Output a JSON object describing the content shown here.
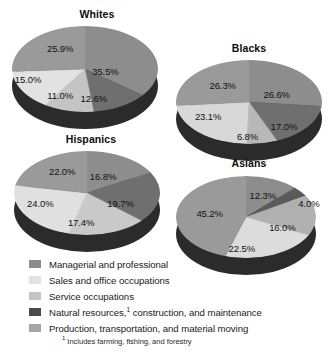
{
  "colors": {
    "managerial": "#8d8d8d",
    "sales": "#e2e2e2",
    "service": "#c4c4c4",
    "natural_resources": "#4a4a4a",
    "production": "#a5a5a5",
    "pie_side": "#2b2b2b",
    "text": "#111111",
    "background": "#ffffff"
  },
  "legend": {
    "items": [
      {
        "label": "Managerial and professional",
        "color": "#8d8d8d",
        "swatch_name": "legend-swatch-managerial"
      },
      {
        "label": "Sales and office occupations",
        "color": "#e2e2e2",
        "swatch_name": "legend-swatch-sales"
      },
      {
        "label": "Service occupations",
        "color": "#c4c4c4",
        "swatch_name": "legend-swatch-service"
      },
      {
        "label": "Natural resources, construction, and maintenance",
        "label_prefix": "Natural resources,",
        "label_suffix": " construction, and maintenance",
        "footnote_marker": "1",
        "color": "#4a4a4a",
        "swatch_name": "legend-swatch-natural-resources"
      },
      {
        "label": "Production, transportation, and material moving",
        "color": "#a5a5a5",
        "swatch_name": "legend-swatch-production"
      }
    ]
  },
  "footnote": {
    "marker": "1",
    "text": " Includes farming, fishing, and forestry"
  },
  "chart_data": [
    {
      "type": "pie",
      "title": "Whites",
      "labels": [
        "Managerial and professional",
        "Natural resources, construction, and maintenance",
        "Service occupations",
        "Sales and office occupations",
        "Production, transportation, and material moving"
      ],
      "values": [
        35.5,
        12.6,
        11.0,
        15.0,
        25.9
      ],
      "value_labels": [
        "35.5%",
        "12.6%",
        "11.0%",
        "15.0%",
        "25.9%"
      ],
      "colors": [
        "#8d8d8d",
        "#6f6f6f",
        "#c4c4c4",
        "#e2e2e2",
        "#9a9a9a"
      ],
      "legend_position": "bottom"
    },
    {
      "type": "pie",
      "title": "Blacks",
      "labels": [
        "Managerial and professional",
        "Production, transportation, and material moving",
        "Natural resources, construction, and maintenance",
        "Service occupations",
        "Sales and office occupations"
      ],
      "values": [
        26.6,
        17.0,
        6.8,
        23.1,
        26.3
      ],
      "value_labels": [
        "26.6%",
        "17.0%",
        "6.8%",
        "23.1%",
        "26.3%"
      ],
      "colors": [
        "#8d8d8d",
        "#6f6f6f",
        "#b8b8b8",
        "#d8d8d8",
        "#9a9a9a"
      ],
      "legend_position": "bottom"
    },
    {
      "type": "pie",
      "title": "Hispanics",
      "labels": [
        "Managerial and professional",
        "Natural resources, construction, and maintenance",
        "Production, transportation, and material moving",
        "Service occupations",
        "Sales and office occupations"
      ],
      "values": [
        16.8,
        19.7,
        17.4,
        24.0,
        22.0
      ],
      "value_labels": [
        "16.8%",
        "19.7%",
        "17.4%",
        "24.0%",
        "22.0%"
      ],
      "colors": [
        "#8d8d8d",
        "#6f6f6f",
        "#c9c9c9",
        "#e0e0e0",
        "#9a9a9a"
      ],
      "legend_position": "bottom"
    },
    {
      "type": "pie",
      "title": "Asians",
      "labels": [
        "Managerial and professional",
        "Natural resources, construction, and maintenance",
        "Production, transportation, and material moving",
        "Service occupations",
        "Sales and office occupations"
      ],
      "values": [
        12.3,
        4.0,
        16.0,
        22.5,
        45.2
      ],
      "value_labels": [
        "12.3%",
        "4.0%",
        "16.0%",
        "22.5%",
        "45.2%"
      ],
      "colors": [
        "#8d8d8d",
        "#5a5a5a",
        "#b0b0b0",
        "#dcdcdc",
        "#9a9a9a"
      ],
      "legend_position": "bottom"
    }
  ],
  "charts_layout": [
    {
      "name": "whites",
      "title": "Whites",
      "box": {
        "left": 12,
        "top": 8,
        "width": 170,
        "height": 128
      },
      "pie": {
        "left": 12,
        "top": 26,
        "width": 146,
        "height": 86,
        "depth": 17
      },
      "start_angle": -90,
      "slices": [
        {
          "value": 35.5,
          "color": "#8d8d8d",
          "label": "35.5%",
          "lx": 0.64,
          "ly": 0.52
        },
        {
          "value": 12.6,
          "color": "#6f6f6f",
          "label": "12.6%",
          "lx": 0.56,
          "ly": 0.84
        },
        {
          "value": 11.0,
          "color": "#c4c4c4",
          "label": "11.0%",
          "lx": 0.33,
          "ly": 0.8
        },
        {
          "value": 15.0,
          "color": "#e2e2e2",
          "label": "15.0%",
          "lx": 0.11,
          "ly": 0.62
        },
        {
          "value": 25.9,
          "color": "#9a9a9a",
          "label": "25.9%",
          "lx": 0.33,
          "ly": 0.25
        }
      ]
    },
    {
      "name": "blacks",
      "title": "Blacks",
      "box": {
        "left": 168,
        "top": 42,
        "width": 162,
        "height": 120
      },
      "pie": {
        "left": 176,
        "top": 60,
        "width": 146,
        "height": 84,
        "depth": 17
      },
      "start_angle": -90,
      "slices": [
        {
          "value": 26.6,
          "color": "#8d8d8d",
          "label": "26.6%",
          "lx": 0.69,
          "ly": 0.41
        },
        {
          "value": 17.0,
          "color": "#6f6f6f",
          "label": "17.0%",
          "lx": 0.74,
          "ly": 0.78
        },
        {
          "value": 6.8,
          "color": "#b8b8b8",
          "label": "6.8%",
          "lx": 0.49,
          "ly": 0.9
        },
        {
          "value": 23.1,
          "color": "#d8d8d8",
          "label": "23.1%",
          "lx": 0.22,
          "ly": 0.67
        },
        {
          "value": 26.3,
          "color": "#9a9a9a",
          "label": "26.3%",
          "lx": 0.32,
          "ly": 0.3
        }
      ]
    },
    {
      "name": "hispanics",
      "title": "Hispanics",
      "box": {
        "left": 8,
        "top": 133,
        "width": 166,
        "height": 122
      },
      "pie": {
        "left": 14,
        "top": 151,
        "width": 146,
        "height": 84,
        "depth": 17
      },
      "start_angle": -90,
      "slices": [
        {
          "value": 16.8,
          "color": "#8d8d8d",
          "label": "16.8%",
          "lx": 0.61,
          "ly": 0.3
        },
        {
          "value": 19.7,
          "color": "#6f6f6f",
          "label": "19.7%",
          "lx": 0.73,
          "ly": 0.62
        },
        {
          "value": 17.4,
          "color": "#c9c9c9",
          "label": "17.4%",
          "lx": 0.46,
          "ly": 0.85
        },
        {
          "value": 24.0,
          "color": "#e0e0e0",
          "label": "24.0%",
          "lx": 0.18,
          "ly": 0.62
        },
        {
          "value": 22.0,
          "color": "#9a9a9a",
          "label": "22.0%",
          "lx": 0.33,
          "ly": 0.24
        }
      ]
    },
    {
      "name": "asians",
      "title": "Asians",
      "box": {
        "left": 166,
        "top": 157,
        "width": 166,
        "height": 122
      },
      "pie": {
        "left": 176,
        "top": 176,
        "width": 140,
        "height": 82,
        "depth": 17
      },
      "start_angle": -90,
      "slices": [
        {
          "value": 12.3,
          "color": "#8d8d8d",
          "label": "12.3%",
          "lx": 0.62,
          "ly": 0.23
        },
        {
          "value": 4.0,
          "color": "#5a5a5a",
          "label": "4.0%",
          "lx": 0.95,
          "ly": 0.33
        },
        {
          "value": 16.0,
          "color": "#b0b0b0",
          "label": "16.0%",
          "lx": 0.76,
          "ly": 0.62
        },
        {
          "value": 22.5,
          "color": "#dcdcdc",
          "label": "22.5%",
          "lx": 0.47,
          "ly": 0.88
        },
        {
          "value": 45.2,
          "color": "#9a9a9a",
          "label": "45.2%",
          "lx": 0.24,
          "ly": 0.45
        }
      ]
    }
  ]
}
